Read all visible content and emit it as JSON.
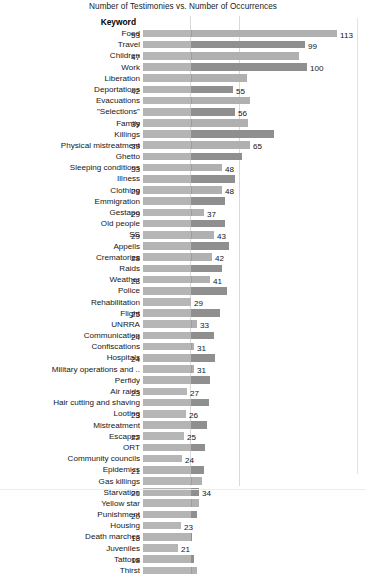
{
  "chart_data": {
    "type": "bar",
    "orientation": "horizontal",
    "title": "Number of Testimonies vs. Number of Occurrences",
    "xlabel": "",
    "ylabel": "Keyword",
    "grid": true,
    "legend_position": "none",
    "xlim": [
      0,
      120
    ],
    "series": [
      {
        "name": "Number of Testimonies",
        "color": "#b2b2b2"
      },
      {
        "name": "Number of Occurrences",
        "color": "#8f8f8f"
      }
    ],
    "categories": [
      "Food",
      "Travel",
      "Children",
      "Work",
      "Liberation",
      "Deportations",
      "Evacuations",
      "\"Selections\"",
      "Family",
      "Killings",
      "Physical mistreatment",
      "Ghetto",
      "Sleeping conditions",
      "Illness",
      "Clothing",
      "Emmigration",
      "Gestapo",
      "Old people",
      "SS",
      "Appells",
      "Crematories",
      "Raids",
      "Weather",
      "Police",
      "Rehabilitation",
      "Flight",
      "UNRRA",
      "Communication",
      "Confiscations",
      "Hospitals",
      "Military operations and ..",
      "Perfidy",
      "Air raids",
      "Hair cutting and shaving",
      "Looting",
      "Mistreatment",
      "Escapes",
      "ORT",
      "Community councils",
      "Epidemics",
      "Gas killings",
      "Starvation",
      "Yellow star",
      "Punishment",
      "Housing",
      "Death marches",
      "Juveniles",
      "Tattoos",
      "Thirst"
    ],
    "rows": [
      {
        "category": "Food",
        "series": 0,
        "value": 113,
        "label_left": "53",
        "label_right": "113",
        "bar_px": 194
      },
      {
        "category": "Travel",
        "series": 1,
        "value": 99,
        "label_left": "",
        "label_right": "99",
        "bar_px": 162
      },
      {
        "category": "Children",
        "series": 0,
        "value": 95,
        "label_left": "47",
        "label_right": "",
        "bar_px": 156
      },
      {
        "category": "Work",
        "series": 1,
        "value": 100,
        "label_left": "",
        "label_right": "100",
        "bar_px": 164
      },
      {
        "category": "Liberation",
        "series": 0,
        "value": 63,
        "label_left": "",
        "label_right": "",
        "bar_px": 104
      },
      {
        "category": "Deportations",
        "series": 1,
        "value": 55,
        "label_left": "42",
        "label_right": "55",
        "bar_px": 90
      },
      {
        "category": "Evacuations",
        "series": 0,
        "value": 65,
        "label_left": "",
        "label_right": "",
        "bar_px": 107
      },
      {
        "category": "\"Selections\"",
        "series": 1,
        "value": 56,
        "label_left": "",
        "label_right": "56",
        "bar_px": 92
      },
      {
        "category": "Family",
        "series": 0,
        "value": 64,
        "label_left": "39",
        "label_right": "",
        "bar_px": 105
      },
      {
        "category": "Killings",
        "series": 1,
        "value": 80,
        "label_left": "",
        "label_right": "",
        "bar_px": 131
      },
      {
        "category": "Physical mistreatment",
        "series": 0,
        "value": 65,
        "label_left": "39",
        "label_right": "65",
        "bar_px": 107
      },
      {
        "category": "Ghetto",
        "series": 1,
        "value": 60,
        "label_left": "",
        "label_right": "",
        "bar_px": 99
      },
      {
        "category": "Sleeping conditions",
        "series": 0,
        "value": 48,
        "label_left": "33",
        "label_right": "48",
        "bar_px": 79
      },
      {
        "category": "Illness",
        "series": 1,
        "value": 56,
        "label_left": "",
        "label_right": "",
        "bar_px": 92
      },
      {
        "category": "Clothing",
        "series": 0,
        "value": 48,
        "label_left": "29",
        "label_right": "48",
        "bar_px": 79
      },
      {
        "category": "Emmigration",
        "series": 1,
        "value": 50,
        "label_left": "",
        "label_right": "",
        "bar_px": 82
      },
      {
        "category": "Gestapo",
        "series": 0,
        "value": 37,
        "label_left": "29",
        "label_right": "37",
        "bar_px": 61
      },
      {
        "category": "Old people",
        "series": 1,
        "value": 50,
        "label_left": "",
        "label_right": "",
        "bar_px": 82
      },
      {
        "category": "SS",
        "series": 0,
        "value": 43,
        "label_left": "29",
        "label_right": "43",
        "bar_px": 71
      },
      {
        "category": "Appells",
        "series": 1,
        "value": 52,
        "label_left": "",
        "label_right": "",
        "bar_px": 86
      },
      {
        "category": "Crematories",
        "series": 0,
        "value": 42,
        "label_left": "28",
        "label_right": "42",
        "bar_px": 69
      },
      {
        "category": "Raids",
        "series": 1,
        "value": 48,
        "label_left": "",
        "label_right": "",
        "bar_px": 79
      },
      {
        "category": "Weather",
        "series": 0,
        "value": 41,
        "label_left": "28",
        "label_right": "41",
        "bar_px": 67
      },
      {
        "category": "Police",
        "series": 1,
        "value": 51,
        "label_left": "",
        "label_right": "",
        "bar_px": 84
      },
      {
        "category": "Rehabilitation",
        "series": 0,
        "value": 29,
        "label_left": "",
        "label_right": "29",
        "bar_px": 48
      },
      {
        "category": "Flight",
        "series": 1,
        "value": 47,
        "label_left": "25",
        "label_right": "",
        "bar_px": 77
      },
      {
        "category": "UNRRA",
        "series": 0,
        "value": 33,
        "label_left": "",
        "label_right": "33",
        "bar_px": 54
      },
      {
        "category": "Communication",
        "series": 1,
        "value": 43,
        "label_left": "24",
        "label_right": "",
        "bar_px": 71
      },
      {
        "category": "Confiscations",
        "series": 0,
        "value": 31,
        "label_left": "",
        "label_right": "31",
        "bar_px": 51
      },
      {
        "category": "Hospitals",
        "series": 1,
        "value": 44,
        "label_left": "24",
        "label_right": "",
        "bar_px": 72
      },
      {
        "category": "Military operations and ..",
        "series": 0,
        "value": 31,
        "label_left": "",
        "label_right": "31",
        "bar_px": 51
      },
      {
        "category": "Perfidy",
        "series": 1,
        "value": 41,
        "label_left": "",
        "label_right": "",
        "bar_px": 67
      },
      {
        "category": "Air raids",
        "series": 0,
        "value": 27,
        "label_left": "23",
        "label_right": "27",
        "bar_px": 44
      },
      {
        "category": "Hair cutting and shaving",
        "series": 1,
        "value": 40,
        "label_left": "",
        "label_right": "",
        "bar_px": 66
      },
      {
        "category": "Looting",
        "series": 0,
        "value": 26,
        "label_left": "23",
        "label_right": "26",
        "bar_px": 43
      },
      {
        "category": "Mistreatment",
        "series": 1,
        "value": 39,
        "label_left": "",
        "label_right": "",
        "bar_px": 64
      },
      {
        "category": "Escapes",
        "series": 0,
        "value": 25,
        "label_left": "22",
        "label_right": "25",
        "bar_px": 41
      },
      {
        "category": "ORT",
        "series": 1,
        "value": 38,
        "label_left": "",
        "label_right": "",
        "bar_px": 62
      },
      {
        "category": "Community councils",
        "series": 0,
        "value": 24,
        "label_left": "",
        "label_right": "24",
        "bar_px": 39
      },
      {
        "category": "Epidemics",
        "series": 1,
        "value": 37,
        "label_left": "21",
        "label_right": "",
        "bar_px": 61
      },
      {
        "category": "Gas killings",
        "series": 0,
        "value": 36,
        "label_left": "",
        "label_right": "",
        "bar_px": 59
      },
      {
        "category": "Starvation",
        "series": 1,
        "value": 34,
        "label_left": "21",
        "label_right": "34",
        "bar_px": 56
      },
      {
        "category": "Yellow star",
        "series": 0,
        "value": 34,
        "label_left": "",
        "label_right": "",
        "bar_px": 56
      },
      {
        "category": "Punishment",
        "series": 1,
        "value": 33,
        "label_left": "20",
        "label_right": "",
        "bar_px": 54
      },
      {
        "category": "Housing",
        "series": 0,
        "value": 23,
        "label_left": "",
        "label_right": "23",
        "bar_px": 38
      },
      {
        "category": "Death marches",
        "series": 1,
        "value": 30,
        "label_left": "18",
        "label_right": "",
        "bar_px": 49
      },
      {
        "category": "Juveniles",
        "series": 0,
        "value": 21,
        "label_left": "",
        "label_right": "21",
        "bar_px": 35
      },
      {
        "category": "Tattoos",
        "series": 1,
        "value": 31,
        "label_left": "18",
        "label_right": "",
        "bar_px": 51
      },
      {
        "category": "Thirst",
        "series": 0,
        "value": 33,
        "label_left": "",
        "label_right": "",
        "bar_px": 54
      }
    ]
  },
  "axis": {
    "keyword_header": "Keyword"
  }
}
